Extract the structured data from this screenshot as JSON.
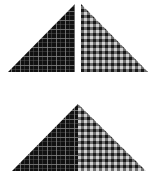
{
  "diagram": {
    "colors": {
      "background": "#ffffff",
      "dark_fabric_base": "#111111",
      "dark_fabric_lines": "#8a8a8a",
      "light_fabric_base": "#1a1a1a",
      "light_fabric_check": "#d0d0d0",
      "light_fabric_mid": "#6e6e6e"
    },
    "pieces": [
      {
        "id": "top-left",
        "fabric": "dark-plaid",
        "points": "75,4 75,72 8,72"
      },
      {
        "id": "top-right",
        "fabric": "light-plaid",
        "points": "81,4 148,72 81,72"
      },
      {
        "id": "bottom-left-half",
        "fabric": "dark-plaid",
        "points": "78,104 78,171 12,171"
      },
      {
        "id": "bottom-right-half",
        "fabric": "light-plaid",
        "points": "78,104 146,171 78,171"
      }
    ]
  }
}
